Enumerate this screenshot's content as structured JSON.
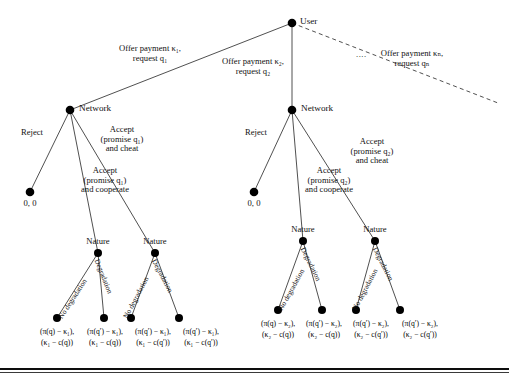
{
  "figure": {
    "type": "game-tree",
    "nodes": {
      "root": {
        "label": "User",
        "x": 292,
        "y": 23,
        "player": "User"
      },
      "network_1": {
        "label": "Network",
        "x": 70,
        "y": 110,
        "player": "Network"
      },
      "network_2": {
        "label": "Network",
        "x": 292,
        "y": 110,
        "player": "Network"
      },
      "reject_leaf_1": {
        "label": "0, 0",
        "x": 30,
        "y": 192
      },
      "reject_leaf_2": {
        "label": "0, 0",
        "x": 254,
        "y": 192
      },
      "nature_1": {
        "label": "Nature",
        "x": 98,
        "y": 253
      },
      "nature_2": {
        "label": "Nature",
        "x": 155,
        "y": 253
      },
      "nature_3": {
        "label": "Nature",
        "x": 303,
        "y": 241
      },
      "nature_4": {
        "label": "Nature",
        "x": 375,
        "y": 241
      }
    },
    "root_edges": [
      {
        "id": "offer-1",
        "line1": "Offer payment κ₁,",
        "line2": "request q₁",
        "style": "solid"
      },
      {
        "id": "offer-2",
        "line1": "Offer payment κ₂,",
        "line2": "request q₂",
        "style": "solid"
      },
      {
        "id": "offer-n",
        "line1": "Offer payment κₙ,",
        "line2": "request qₙ",
        "style": "dashed"
      }
    ],
    "ellipsis": "....",
    "network_edges_left": [
      {
        "id": "reject-1",
        "label": "Reject"
      },
      {
        "id": "accept-coop-1",
        "line1": "Accept",
        "line2": "(promise q₁)",
        "line3": "and cooperate"
      },
      {
        "id": "accept-cheat-1",
        "line1": "Accept",
        "line2": "(promise q₁)",
        "line3": "and cheat"
      }
    ],
    "network_edges_right": [
      {
        "id": "reject-2",
        "label": "Reject"
      },
      {
        "id": "accept-coop-2",
        "line1": "Accept",
        "line2": "(promise q₂)",
        "line3": "and cooperate"
      },
      {
        "id": "accept-cheat-2",
        "line1": "Accept",
        "line2": "(promise q₂)",
        "line3": "and cheat"
      }
    ],
    "nature_edges": {
      "no_degradation": "No degradation",
      "degradation": "Degradation"
    },
    "payoffs_left": [
      {
        "id": "leaf-1",
        "x": 57,
        "line1": "(π(q) − κ₁),",
        "line2": "(κ₁ − c(q))"
      },
      {
        "id": "leaf-2",
        "x": 104,
        "line1": "(π(q′) − κ₁),",
        "line2": "(κ₁ − c(q))"
      },
      {
        "id": "leaf-3",
        "x": 131,
        "line1": "(π(q′) − κ₁),",
        "line2": "(κ₁ − c(q′))"
      },
      {
        "id": "leaf-4",
        "x": 179,
        "line1": "(π(q′) − κ₁),",
        "line2": "(κ₁ − c(q′))"
      }
    ],
    "payoffs_right": [
      {
        "id": "leaf-5",
        "x": 278,
        "line1": "(π(q) − κ₂),",
        "line2": "(κ₂ − c(q))"
      },
      {
        "id": "leaf-6",
        "x": 322,
        "line1": "(π(q′) − κ₂),",
        "line2": "(κ₂ − c(q))"
      },
      {
        "id": "leaf-7",
        "x": 366,
        "line1": "(π(q′) − κ₂),",
        "line2": "(κ₂ − c(q′))"
      },
      {
        "id": "leaf-8",
        "x": 412,
        "line1": "(π(q′) − κ₂),",
        "line2": "(κ₂ − c(q′))"
      }
    ],
    "colors": {
      "node": "#000000",
      "edge": "#3c3c3c",
      "text": "#111111",
      "background": "#ffffff",
      "rule": "#0d0d0d"
    }
  }
}
